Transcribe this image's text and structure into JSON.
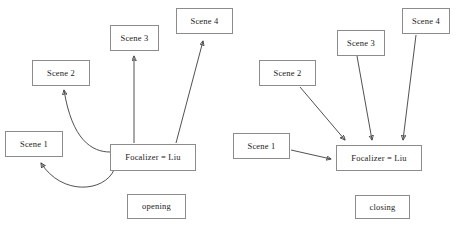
{
  "diagram": {
    "background_color": "#ffffff",
    "box_border_color": "#8c8c8c",
    "arrow_color": "#3d3d3d",
    "text_color": "#1a1a1a"
  },
  "panels": [
    {
      "id": "opening",
      "caption": "opening",
      "center_label": "Focalizer = Liu",
      "nodes": [
        {
          "id": "scene1",
          "label": "Scene 1"
        },
        {
          "id": "scene2",
          "label": "Scene 2"
        },
        {
          "id": "scene3",
          "label": "Scene 3"
        },
        {
          "id": "scene4",
          "label": "Scene 4"
        }
      ],
      "arrow_direction": "from-focalizer-to-scenes",
      "arrows": [
        {
          "from": "Focalizer = Liu",
          "to": "Scene 1",
          "style": "curved"
        },
        {
          "from": "Focalizer = Liu",
          "to": "Scene 2",
          "style": "curved"
        },
        {
          "from": "Focalizer = Liu",
          "to": "Scene 3",
          "style": "straight"
        },
        {
          "from": "Focalizer = Liu",
          "to": "Scene 4",
          "style": "straight"
        }
      ]
    },
    {
      "id": "closing",
      "caption": "closing",
      "center_label": "Focalizer = Liu",
      "nodes": [
        {
          "id": "scene1",
          "label": "Scene 1"
        },
        {
          "id": "scene2",
          "label": "Scene 2"
        },
        {
          "id": "scene3",
          "label": "Scene 3"
        },
        {
          "id": "scene4",
          "label": "Scene 4"
        }
      ],
      "arrow_direction": "from-scenes-to-focalizer",
      "arrows": [
        {
          "from": "Scene 1",
          "to": "Focalizer = Liu",
          "style": "straight"
        },
        {
          "from": "Scene 2",
          "to": "Focalizer = Liu",
          "style": "straight"
        },
        {
          "from": "Scene 3",
          "to": "Focalizer = Liu",
          "style": "straight"
        },
        {
          "from": "Scene 4",
          "to": "Focalizer = Liu",
          "style": "straight"
        }
      ]
    }
  ]
}
